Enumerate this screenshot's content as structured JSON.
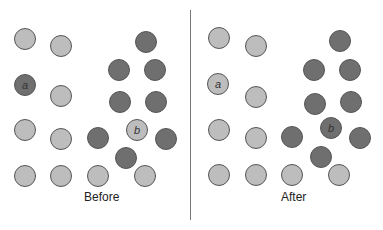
{
  "panels": [
    {
      "caption": "Before",
      "caption_x": 84,
      "caption_y": 190,
      "circles": [
        {
          "x": 25,
          "y": 39,
          "shade": "light"
        },
        {
          "x": 61,
          "y": 46,
          "shade": "light"
        },
        {
          "x": 146,
          "y": 42,
          "shade": "dark"
        },
        {
          "x": 119,
          "y": 70,
          "shade": "dark"
        },
        {
          "x": 155,
          "y": 70,
          "shade": "dark"
        },
        {
          "x": 25,
          "y": 85,
          "shade": "dark",
          "label": "a"
        },
        {
          "x": 61,
          "y": 96,
          "shade": "light"
        },
        {
          "x": 120,
          "y": 102,
          "shade": "dark"
        },
        {
          "x": 156,
          "y": 102,
          "shade": "dark"
        },
        {
          "x": 25,
          "y": 130,
          "shade": "light"
        },
        {
          "x": 61,
          "y": 139,
          "shade": "light"
        },
        {
          "x": 98,
          "y": 138,
          "shade": "dark"
        },
        {
          "x": 137,
          "y": 130,
          "shade": "light",
          "label": "b"
        },
        {
          "x": 166,
          "y": 139,
          "shade": "dark"
        },
        {
          "x": 126,
          "y": 158,
          "shade": "dark"
        },
        {
          "x": 25,
          "y": 176,
          "shade": "light"
        },
        {
          "x": 61,
          "y": 176,
          "shade": "light"
        },
        {
          "x": 98,
          "y": 176,
          "shade": "light"
        },
        {
          "x": 145,
          "y": 176,
          "shade": "light"
        }
      ]
    },
    {
      "caption": "After",
      "caption_x": 281,
      "caption_y": 190,
      "circles": [
        {
          "x": 219,
          "y": 38,
          "shade": "light"
        },
        {
          "x": 256,
          "y": 46,
          "shade": "light"
        },
        {
          "x": 340,
          "y": 41,
          "shade": "dark"
        },
        {
          "x": 314,
          "y": 70,
          "shade": "dark"
        },
        {
          "x": 350,
          "y": 70,
          "shade": "dark"
        },
        {
          "x": 218,
          "y": 84,
          "shade": "light",
          "label": "a"
        },
        {
          "x": 256,
          "y": 97,
          "shade": "light"
        },
        {
          "x": 315,
          "y": 104,
          "shade": "dark"
        },
        {
          "x": 351,
          "y": 102,
          "shade": "dark"
        },
        {
          "x": 219,
          "y": 130,
          "shade": "light"
        },
        {
          "x": 256,
          "y": 138,
          "shade": "light"
        },
        {
          "x": 292,
          "y": 137,
          "shade": "dark"
        },
        {
          "x": 331,
          "y": 128,
          "shade": "dark",
          "label": "b"
        },
        {
          "x": 360,
          "y": 138,
          "shade": "dark"
        },
        {
          "x": 321,
          "y": 157,
          "shade": "dark"
        },
        {
          "x": 219,
          "y": 175,
          "shade": "light"
        },
        {
          "x": 256,
          "y": 175,
          "shade": "light"
        },
        {
          "x": 292,
          "y": 175,
          "shade": "light"
        },
        {
          "x": 339,
          "y": 175,
          "shade": "light"
        }
      ]
    }
  ]
}
